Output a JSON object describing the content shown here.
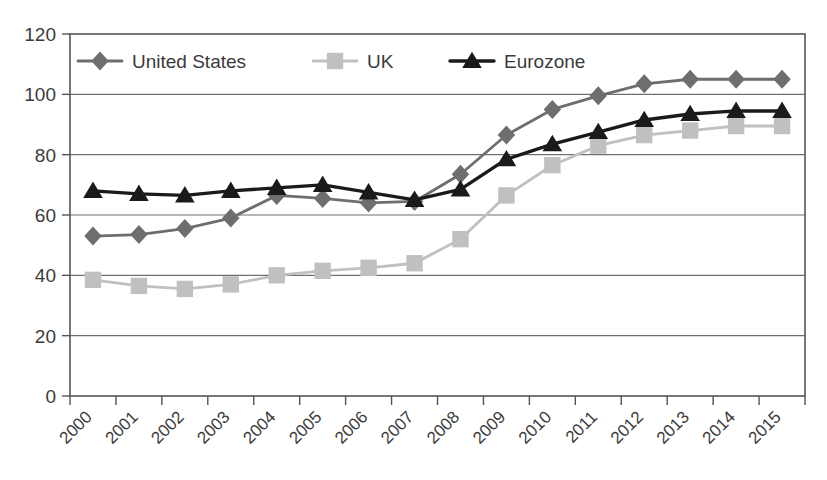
{
  "chart_data": {
    "type": "line",
    "title": "",
    "subtitle": "",
    "xlabel": "",
    "ylabel": "",
    "categories": [
      "2000",
      "2001",
      "2002",
      "2003",
      "2004",
      "2005",
      "2006",
      "2007",
      "2008",
      "2009",
      "2010",
      "2011",
      "2012",
      "2013",
      "2014",
      "2015"
    ],
    "ylim": [
      0,
      120
    ],
    "yticks": [
      0,
      20,
      40,
      60,
      80,
      100,
      120
    ],
    "ytick_labels": [
      "0",
      "20",
      "40",
      "60",
      "80",
      "100",
      "120"
    ],
    "grid": "horizontal",
    "legend_position": "top-inside",
    "series": [
      {
        "name": "United States",
        "color": "#6e6e6e",
        "marker": "diamond",
        "values": [
          53,
          53.5,
          55.5,
          59,
          66.5,
          65.5,
          64,
          64.5,
          73.5,
          86.5,
          95,
          99.5,
          103.5,
          105,
          105,
          105
        ]
      },
      {
        "name": "UK",
        "color": "#c0c0c0",
        "marker": "square",
        "values": [
          38.5,
          36.5,
          35.5,
          37,
          40,
          41.5,
          42.5,
          44,
          52,
          66.5,
          76.5,
          83,
          86.5,
          88,
          89.5,
          89.5
        ]
      },
      {
        "name": "Eurozone",
        "color": "#1a1a1a",
        "marker": "triangle",
        "values": [
          68,
          67,
          66.5,
          68,
          69,
          70,
          67.5,
          65,
          68.5,
          78.5,
          83.5,
          87.5,
          91.5,
          93.5,
          94.5,
          94.5
        ]
      }
    ],
    "legend": [
      {
        "label": "United States",
        "color": "#6e6e6e",
        "marker": "diamond"
      },
      {
        "label": "UK",
        "color": "#c0c0c0",
        "marker": "square"
      },
      {
        "label": "Eurozone",
        "color": "#1a1a1a",
        "marker": "triangle"
      }
    ]
  },
  "colors": {
    "background": "#ffffff",
    "axis": "#555555",
    "grid": "#6f6f6f",
    "text": "#3b3b3b",
    "united_states": "#6e6e6e",
    "uk": "#c0c0c0",
    "eurozone": "#1a1a1a"
  }
}
